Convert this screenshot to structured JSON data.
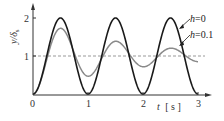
{
  "chart_data": {
    "type": "line",
    "title": "",
    "xlabel": "t [s]",
    "ylabel": "y/δs",
    "xlim": [
      0,
      3.2
    ],
    "ylim": [
      0,
      2.2
    ],
    "xticks": [
      "0",
      "1",
      "2",
      "3"
    ],
    "yticks": [
      "1",
      "2"
    ],
    "reference_line": {
      "y": 1,
      "style": "dashed"
    },
    "series": [
      {
        "name": "h=0",
        "color": "#222222",
        "formula": "1 - cos(2*pi*t)",
        "x": [
          0,
          0.25,
          0.5,
          0.75,
          1,
          1.25,
          1.5,
          1.75,
          2,
          2.25,
          2.5,
          2.75,
          3
        ],
        "values": [
          0,
          1,
          2,
          1,
          0,
          1,
          2,
          1,
          0,
          1,
          2,
          1,
          0
        ]
      },
      {
        "name": "h=0.1",
        "color": "#777777",
        "formula": "damped step response, h=0.1",
        "x": [
          0,
          0.25,
          0.5,
          0.75,
          1,
          1.25,
          1.5,
          1.75,
          2,
          2.25,
          2.5,
          2.75,
          3
        ],
        "values": [
          0,
          0.94,
          1.73,
          1.05,
          0.53,
          0.97,
          1.39,
          1.02,
          0.78,
          0.99,
          1.15,
          1.01,
          0.9
        ]
      }
    ],
    "legend": [
      {
        "label": "h=0"
      },
      {
        "label": "h=0.1"
      }
    ],
    "grid": false
  },
  "axis": {
    "x_label_t": "t",
    "x_label_unit": "[ s ]",
    "y_label_main": "y/δ",
    "y_label_sub": "s"
  },
  "legend_labels": {
    "h0": "h=0",
    "h01": "h=0.1"
  },
  "ticks": {
    "x0": "0",
    "x1": "1",
    "x2": "2",
    "x3": "3",
    "y1": "1",
    "y2": "2"
  }
}
